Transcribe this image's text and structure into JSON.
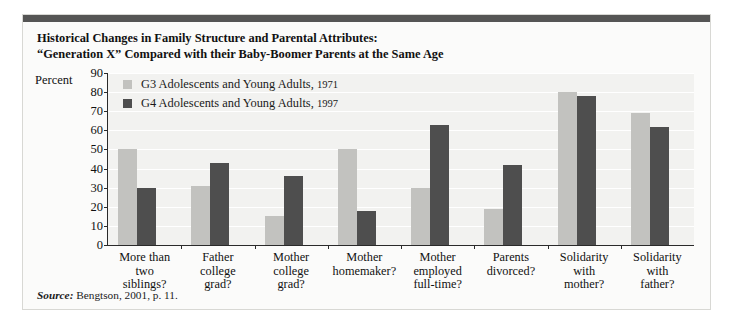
{
  "figure": {
    "title_line1": "Historical Changes in Family Structure and Parental Attributes:",
    "title_line2": "“Generation X” Compared with their Baby-Boomer Parents at the Same Age",
    "source_prefix": "Source:",
    "source_text": " Bengtson, 2001, p. 11."
  },
  "legend": {
    "position": "inside-top-left",
    "entries": [
      {
        "label": "G3 Adolescents and Young Adults,",
        "year": "1971",
        "color": "#c2c2bf",
        "swatch_name": "series-1-swatch"
      },
      {
        "label": "G4 Adolescents and Young Adults,",
        "year": "1997",
        "color": "#4e4e4e",
        "swatch_name": "series-2-swatch"
      }
    ]
  },
  "chart_data": {
    "type": "bar",
    "title": "Historical Changes in Family Structure and Parental Attributes: “Generation X” Compared with their Baby-Boomer Parents at the Same Age",
    "xlabel": "",
    "ylabel": "Percent",
    "ylim": [
      0,
      90
    ],
    "yticks": [
      0,
      10,
      20,
      30,
      40,
      50,
      60,
      70,
      80,
      90
    ],
    "ytick_labels": [
      "0",
      "10",
      "20",
      "30",
      "40",
      "50",
      "60",
      "70",
      "80",
      "90"
    ],
    "grid": true,
    "grid_axis": "y",
    "grid_color": "#ffffff",
    "plot_background": "#f2f2f0",
    "categories": [
      "More than two siblings?",
      "Father college grad?",
      "Mother college grad?",
      "Mother homemaker?",
      "Mother employed full-time?",
      "Parents divorced?",
      "Solidarity with mother?",
      "Solidarity with father?"
    ],
    "category_lines": [
      [
        "More than",
        "two",
        "siblings?"
      ],
      [
        "Father",
        "college",
        "grad?"
      ],
      [
        "Mother",
        "college",
        "grad?"
      ],
      [
        "Mother",
        "homemaker?"
      ],
      [
        "Mother",
        "employed",
        "full-time?"
      ],
      [
        "Parents",
        "divorced?"
      ],
      [
        "Solidarity",
        "with",
        "mother?"
      ],
      [
        "Solidarity",
        "with",
        "father?"
      ]
    ],
    "series": [
      {
        "name": "G3 Adolescents and Young Adults, 1971",
        "color": "#c2c2bf",
        "values": [
          50,
          31,
          15,
          50,
          30,
          19,
          80,
          69
        ]
      },
      {
        "name": "G4 Adolescents and Young Adults, 1997",
        "color": "#4e4e4e",
        "values": [
          30,
          43,
          36,
          18,
          63,
          42,
          78,
          62
        ]
      }
    ]
  }
}
